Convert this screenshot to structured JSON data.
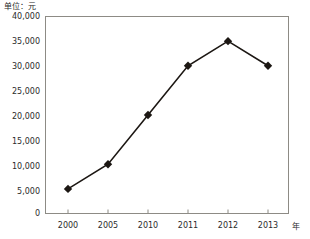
{
  "chart_data": {
    "type": "line",
    "title": "",
    "subtitle": "",
    "xlabel": "年",
    "ylabel": "单位：元",
    "unit_note": "单位：元",
    "categories": [
      "2000",
      "2005",
      "2010",
      "2011",
      "2012",
      "2013"
    ],
    "x": [
      2000,
      2005,
      2010,
      2011,
      2012,
      2013
    ],
    "values": [
      5000,
      10000,
      20000,
      30000,
      35000,
      30000
    ],
    "series": [
      {
        "name": "",
        "values": [
          5000,
          10000,
          20000,
          30000,
          35000,
          30000
        ]
      }
    ],
    "ylim": [
      0,
      40000
    ],
    "yticks": [
      0,
      5000,
      10000,
      15000,
      20000,
      25000,
      30000,
      35000,
      40000
    ],
    "ytick_labels": [
      "0",
      "5,000",
      "10,000",
      "15,000",
      "20,000",
      "25,000",
      "30,000",
      "35,000",
      "40,000"
    ],
    "xtick_labels": [
      "2000",
      "2005",
      "2010",
      "2011",
      "2012",
      "2013"
    ],
    "grid": false,
    "legend": false,
    "legend_position": "none",
    "marker": "diamond",
    "line_color": "#1c1713",
    "marker_color": "#1c1713",
    "frame_color": "#8d8b85",
    "background": "#ffffff"
  },
  "axis": {
    "y_unit": "单位：元",
    "x_unit": "年"
  }
}
